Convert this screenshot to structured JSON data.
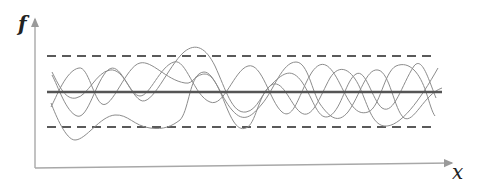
{
  "diagram": {
    "y_axis_label": "f",
    "x_axis_label": "x",
    "colors": {
      "axis": "#a8a8a8",
      "mean_line": "#555555",
      "bound_lines": "#5a5a5a",
      "curves": "#8c8c8c"
    },
    "mean_line": {
      "x1": 47,
      "x2": 442,
      "y": 92,
      "style": "solid"
    },
    "upper_bound": {
      "x1": 47,
      "x2": 437,
      "y": 56,
      "style": "dashed"
    },
    "lower_bound": {
      "x1": 47,
      "x2": 437,
      "y": 127,
      "style": "dashed"
    },
    "curves": [
      {
        "name": "curve-1",
        "d": "M52,75 C58,86 66,112 77,116 C88,120 96,80 108,70 C120,60 128,92 140,100 C152,108 168,66 184,52 C196,42 206,48 215,66 C226,90 232,114 246,112 C258,110 262,92 272,84 C284,72 292,68 302,82 C314,100 318,122 330,116 C342,108 346,80 356,74 C366,68 372,100 382,108 C394,116 402,84 414,66 C422,56 428,78 436,98"
      },
      {
        "name": "curve-2",
        "d": "M51,107 C56,98 66,70 79,68 C88,66 94,100 102,104 C112,110 126,66 140,63 C152,60 166,80 185,83 C194,85 196,72 204,72 C214,72 220,96 232,110 C244,124 252,116 262,104 C274,90 282,62 296,62 C308,62 312,92 320,104 C330,118 338,124 348,112 C360,96 366,68 378,70 C390,72 394,110 404,118 C414,124 424,94 442,88"
      },
      {
        "name": "curve-3",
        "d": "M51,103 C56,116 66,140 75,140 C86,140 100,116 115,115 C128,114 134,126 150,128 C164,130 172,126 180,120 C188,112 190,80 198,76 C206,72 212,72 222,96 C230,116 236,132 246,128 C256,124 258,96 270,86 C282,76 290,104 300,112 C312,122 320,96 330,78 C340,62 352,70 360,88 C368,106 372,124 384,126 C400,128 420,100 438,68"
      },
      {
        "name": "curve-4",
        "d": "M52,72 C60,88 66,100 76,98 C88,96 96,72 110,70 C124,68 130,96 140,96 C150,96 160,66 174,62 C186,58 194,96 210,102 C224,108 234,70 248,66 C262,62 270,102 282,112 C294,122 300,90 312,72 C322,58 330,64 340,84 C350,104 356,116 368,112 C380,108 384,72 396,66 C410,60 420,74 426,92 C430,104 432,112 435,116"
      }
    ]
  }
}
